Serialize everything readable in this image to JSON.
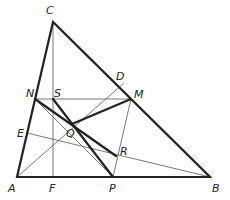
{
  "figure": {
    "type": "geometry"
  },
  "points": {
    "A": {
      "label": "A",
      "x": 17,
      "y": 177
    },
    "B": {
      "label": "B",
      "x": 210,
      "y": 177
    },
    "C": {
      "label": "C",
      "x": 53,
      "y": 22
    },
    "D": {
      "label": "D",
      "x": 124,
      "y": 83
    },
    "E": {
      "label": "E",
      "x": 27,
      "y": 133
    },
    "F": {
      "label": "F",
      "x": 53,
      "y": 177
    },
    "M": {
      "label": "M",
      "x": 131,
      "y": 99
    },
    "N": {
      "label": "N",
      "x": 35,
      "y": 99
    },
    "P": {
      "label": "P",
      "x": 113,
      "y": 177
    },
    "Q": {
      "label": "Q",
      "x": 72,
      "y": 124
    },
    "R": {
      "label": "R",
      "x": 116,
      "y": 156
    },
    "S": {
      "label": "S",
      "x": 53,
      "y": 99
    }
  },
  "labels": {
    "A": "A",
    "B": "B",
    "C": "C",
    "D": "D",
    "E": "E",
    "F": "F",
    "M": "M",
    "N": "N",
    "P": "P",
    "Q": "Q",
    "R": "R",
    "S": "S"
  },
  "segments": {
    "thick": [
      [
        "A",
        "B"
      ],
      [
        "B",
        "C"
      ],
      [
        "C",
        "A"
      ],
      [
        "N",
        "R"
      ],
      [
        "S",
        "P"
      ],
      [
        "M",
        "Q"
      ]
    ],
    "thin": [
      [
        "C",
        "F"
      ],
      [
        "A",
        "D"
      ],
      [
        "B",
        "E"
      ],
      [
        "N",
        "M"
      ],
      [
        "M",
        "P"
      ],
      [
        "N",
        "P"
      ]
    ]
  }
}
